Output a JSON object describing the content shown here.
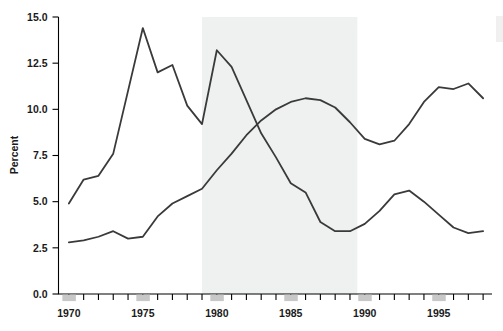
{
  "chart_data": {
    "type": "line",
    "title": "",
    "subtitle": "",
    "xlabel": "",
    "ylabel": "Percent",
    "xlim": [
      1969.3,
      1998.6
    ],
    "ylim": [
      0.0,
      15.0
    ],
    "grid": false,
    "legend": "none",
    "y_ticks": [
      "0.0",
      "2.5",
      "5.0",
      "7.5",
      "10.0",
      "12.5",
      "15.0"
    ],
    "y_tick_values": [
      0.0,
      2.5,
      5.0,
      7.5,
      10.0,
      12.5,
      15.0
    ],
    "x_ticks": [
      "1970",
      "1975",
      "1980",
      "1985",
      "1990",
      "1995"
    ],
    "x_tick_values": [
      1970,
      1975,
      1980,
      1985,
      1990,
      1995
    ],
    "x_minor_step": 1,
    "annotations": [
      {
        "name": "shaded-period-band",
        "type": "vspan",
        "x_start": 1979.0,
        "x_end": 1989.5,
        "color": "#eff0f0"
      }
    ],
    "series": [
      {
        "name": "series-upper-volatile",
        "color": "#3a3a3a",
        "x": [
          1970,
          1971,
          1972,
          1973,
          1974,
          1975,
          1976,
          1977,
          1978,
          1979,
          1980,
          1981,
          1982,
          1983,
          1984,
          1985,
          1986,
          1987,
          1988,
          1989,
          1990,
          1991,
          1992,
          1993,
          1994,
          1995,
          1996,
          1997,
          1998
        ],
        "values": [
          4.9,
          6.2,
          6.4,
          7.6,
          11.0,
          14.4,
          12.0,
          12.4,
          10.2,
          9.2,
          13.2,
          12.3,
          10.5,
          8.7,
          7.4,
          6.0,
          5.5,
          3.9,
          3.4,
          3.4,
          3.8,
          4.5,
          5.4,
          5.6,
          5.0,
          4.3,
          3.6,
          3.3,
          3.4
        ]
      },
      {
        "name": "series-lower-rising",
        "color": "#3a3a3a",
        "x": [
          1970,
          1971,
          1972,
          1973,
          1974,
          1975,
          1976,
          1977,
          1978,
          1979,
          1980,
          1981,
          1982,
          1983,
          1984,
          1985,
          1986,
          1987,
          1988,
          1989,
          1990,
          1991,
          1992,
          1993,
          1994,
          1995,
          1996,
          1997,
          1998
        ],
        "values": [
          2.8,
          2.9,
          3.1,
          3.4,
          3.0,
          3.1,
          4.2,
          4.9,
          5.3,
          5.7,
          6.7,
          7.6,
          8.6,
          9.4,
          10.0,
          10.4,
          10.6,
          10.5,
          10.1,
          9.3,
          8.4,
          8.1,
          8.3,
          9.2,
          10.4,
          11.2,
          11.1,
          11.4,
          10.6
        ]
      }
    ]
  },
  "axis": {
    "y_title": "Percent"
  }
}
